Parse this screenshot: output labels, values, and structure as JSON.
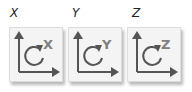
{
  "rotate_buttons": [
    {
      "label": "X",
      "axis_letter": "X",
      "icon": "rotate-around-axis-icon"
    },
    {
      "label": "Y",
      "axis_letter": "Y",
      "icon": "rotate-around-axis-icon"
    },
    {
      "label": "Z",
      "axis_letter": "Z",
      "icon": "rotate-around-axis-icon"
    }
  ],
  "colors": {
    "icon_stroke": "#555555",
    "axis_letter": "#808080",
    "button_bg": "#f4f4f4"
  }
}
